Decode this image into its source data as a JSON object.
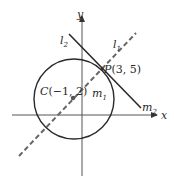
{
  "diagram": {
    "axes": {
      "x_label": "x",
      "y_label": "y"
    },
    "circle": {
      "center_label": "C(−1, 2)",
      "center": [
        -1,
        2
      ]
    },
    "point": {
      "label": "P(3, 5)",
      "coords": [
        3,
        5
      ]
    },
    "lines": [
      {
        "name": "l",
        "sub": "1",
        "style": "dashed",
        "slope_label": "m",
        "slope_sub": "1"
      },
      {
        "name": "l",
        "sub": "2",
        "style": "solid",
        "slope_label": "m",
        "slope_sub": "2"
      }
    ],
    "colors": {
      "ink": "#2a2a2a",
      "dash": "#555555",
      "axis": "#444444"
    }
  }
}
